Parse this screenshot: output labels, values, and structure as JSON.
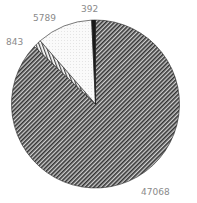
{
  "chart_data": {
    "type": "pie",
    "title": "",
    "start_angle": "12 o'clock",
    "direction": "clockwise",
    "slices": [
      {
        "label": "47068",
        "value": 47068,
        "pattern": "dense-diagonal-hatch",
        "color": "#555555"
      },
      {
        "label": "843",
        "value": 843,
        "pattern": "vertical-lines",
        "color": "#bbbbbb"
      },
      {
        "label": "5789",
        "value": 5789,
        "pattern": "light-dots",
        "color": "#f2f2f2"
      },
      {
        "label": "392",
        "value": 392,
        "pattern": "solid-dark",
        "color": "#1a1a1a"
      }
    ],
    "values": [
      47068,
      843,
      5789,
      392
    ],
    "categories": [
      "47068",
      "843",
      "5789",
      "392"
    ],
    "legend": "none",
    "label_color": "#8a8a8a"
  },
  "labels": {
    "slice_0": "47068",
    "slice_1": "843",
    "slice_2": "5789",
    "slice_3": "392"
  }
}
